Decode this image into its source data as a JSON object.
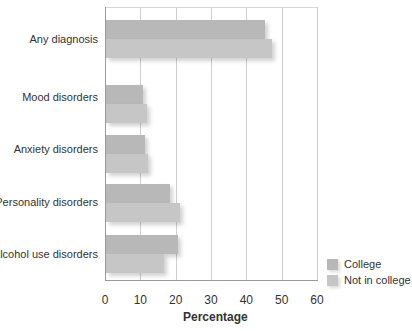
{
  "chart_data": {
    "type": "bar",
    "orientation": "horizontal",
    "title": "",
    "xlabel": "Percentage",
    "ylabel": "",
    "xlim": [
      0,
      60
    ],
    "xticks": [
      "0",
      "10",
      "20",
      "30",
      "40",
      "50",
      "60"
    ],
    "grid": true,
    "legend_position": "bottom-right",
    "categories": [
      "Any diagnosis",
      "Mood disorders",
      "Anxiety disorders",
      "Personality disorders",
      "Alcohol use disorders"
    ],
    "series": [
      {
        "name": "College",
        "values": [
          45,
          10.5,
          11,
          18,
          20.5
        ],
        "color": "#b8b8b8"
      },
      {
        "name": "Not in college",
        "values": [
          47,
          11.5,
          12,
          21,
          16.5
        ],
        "color": "#c6c6c6"
      }
    ]
  },
  "labels": {
    "categories": [
      "Any diagnosis",
      "Mood disorders",
      "Anxiety disorders",
      "Personality disorders",
      "Alcohol use disorders"
    ],
    "xticks": [
      "0",
      "10",
      "20",
      "30",
      "40",
      "50",
      "60"
    ],
    "xlabel": "Percentage",
    "legend": [
      "College",
      "Not in college"
    ]
  }
}
